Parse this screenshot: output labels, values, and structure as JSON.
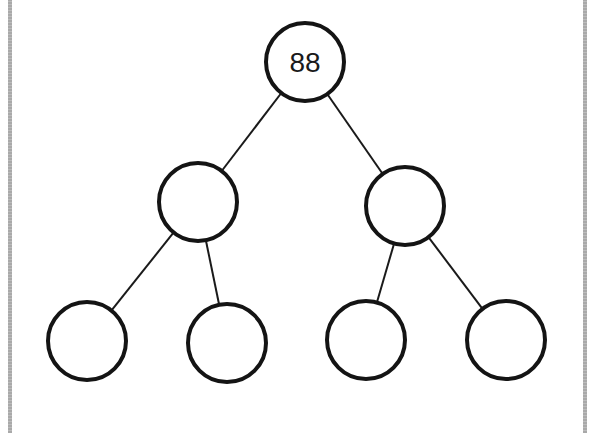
{
  "diagram": {
    "type": "binary-tree",
    "levels": 3,
    "colors": {
      "stroke": "#141414",
      "fill": "#ffffff",
      "frame": "#a9a9a9"
    },
    "nodes": [
      {
        "id": "root",
        "label": "88",
        "cx": 305,
        "cy": 62,
        "r": 39
      },
      {
        "id": "left",
        "label": "",
        "cx": 198,
        "cy": 202,
        "r": 39
      },
      {
        "id": "right",
        "label": "",
        "cx": 405,
        "cy": 206,
        "r": 39
      },
      {
        "id": "left-left",
        "label": "",
        "cx": 87,
        "cy": 341,
        "r": 39
      },
      {
        "id": "left-right",
        "label": "",
        "cx": 227,
        "cy": 343,
        "r": 39
      },
      {
        "id": "right-left",
        "label": "",
        "cx": 366,
        "cy": 340,
        "r": 39
      },
      {
        "id": "right-right",
        "label": "",
        "cx": 506,
        "cy": 340,
        "r": 39
      }
    ],
    "edges": [
      {
        "from": "root",
        "to": "left"
      },
      {
        "from": "root",
        "to": "right"
      },
      {
        "from": "left",
        "to": "left-left"
      },
      {
        "from": "left",
        "to": "left-right"
      },
      {
        "from": "right",
        "to": "right-left"
      },
      {
        "from": "right",
        "to": "right-right"
      }
    ]
  }
}
